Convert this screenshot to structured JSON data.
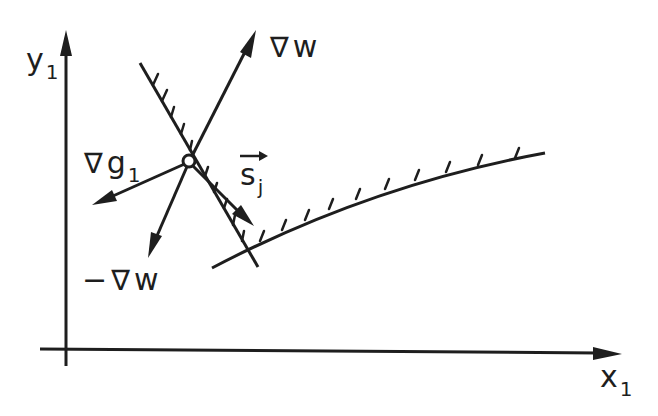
{
  "diagram": {
    "type": "feasible-direction geometry sketch",
    "colors": {
      "ink": "#1e1e1e",
      "background": "#ffffff"
    },
    "axes": {
      "x": {
        "label": "x",
        "subscript": "1"
      },
      "y": {
        "label": "y",
        "subscript": "1"
      }
    },
    "point": {
      "marker": "open-circle"
    },
    "vectors": [
      {
        "id": "grad-w",
        "nabla": "∇",
        "label": "w",
        "prefix": ""
      },
      {
        "id": "neg-grad-w",
        "nabla": "∇",
        "label": "w",
        "prefix": "−"
      },
      {
        "id": "grad-g1",
        "nabla": "∇",
        "label": "g",
        "subscript": "1"
      },
      {
        "id": "search-direction",
        "label": "s",
        "subscript": "j",
        "overarrow": "→"
      }
    ],
    "constraints": [
      {
        "id": "constraint-line-1",
        "style": "hatched straight line"
      },
      {
        "id": "constraint-curve-2",
        "style": "hatched curve"
      }
    ]
  }
}
